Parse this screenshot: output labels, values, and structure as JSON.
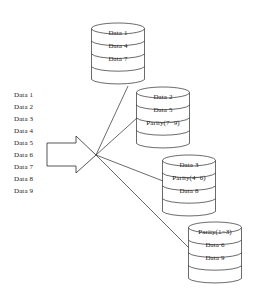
{
  "diagram": {
    "stroke_color": "#2b2b2b",
    "text_color": "#1a1a1a",
    "background_color": "#ffffff"
  },
  "source_stream": {
    "name": "input-data-stream",
    "items": [
      "Data 1",
      "Data 2",
      "Data 3",
      "Data 4",
      "Data 5",
      "Data 6",
      "Data 7",
      "Data 8",
      "Data 9"
    ]
  },
  "arrow": {
    "name": "distribution-arrow",
    "direction": "right"
  },
  "disks": [
    {
      "name": "disk-1",
      "x": 91,
      "y": 23,
      "width": 54,
      "height": 62,
      "bands": [
        "Data 1",
        "Data 4",
        "Data 7",
        ""
      ]
    },
    {
      "name": "disk-2",
      "x": 136,
      "y": 87,
      "width": 54,
      "height": 62,
      "bands": [
        "Data 2",
        "Data 5",
        "Parity(7−9)",
        ""
      ]
    },
    {
      "name": "disk-3",
      "x": 162,
      "y": 155,
      "width": 54,
      "height": 62,
      "bands": [
        "Data 3",
        "Parity(4−6)",
        "Data 8",
        ""
      ]
    },
    {
      "name": "disk-4",
      "x": 188,
      "y": 222,
      "width": 54,
      "height": 62,
      "bands": [
        "Parity(1−3)",
        "Data 6",
        "Data 9",
        ""
      ]
    }
  ],
  "connectors": {
    "name": "distribution-connectors",
    "junction_x": 96,
    "junction_y": 155,
    "targets": [
      {
        "name": "connector-to-disk-1",
        "x": 128,
        "y": 86
      },
      {
        "name": "connector-to-disk-2",
        "x": 137,
        "y": 118
      },
      {
        "name": "connector-to-disk-3",
        "x": 163,
        "y": 181
      },
      {
        "name": "connector-to-disk-4",
        "x": 189,
        "y": 248
      }
    ]
  }
}
